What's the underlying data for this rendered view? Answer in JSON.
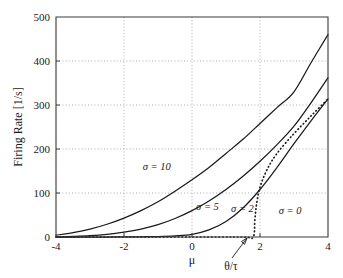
{
  "chart_data": {
    "type": "line",
    "title": "",
    "xlabel": "μ",
    "ylabel": "Firing Rate [1/s]",
    "xlim": [
      -4,
      4
    ],
    "ylim": [
      0,
      500
    ],
    "xticks": [
      -4,
      -2,
      0,
      2,
      4
    ],
    "xticklabels": [
      "-4",
      "-2",
      "0",
      "2",
      "4"
    ],
    "yticks": [
      0,
      100,
      200,
      300,
      400,
      500
    ],
    "yticklabels": [
      "0",
      "100",
      "200",
      "300",
      "400",
      "500"
    ],
    "grid": true,
    "grid_style": "dotted",
    "legend_position": "inline-annotations",
    "annotations": [
      {
        "text": "θ/τ",
        "x": 1.8,
        "y": 0,
        "note": "arrow pointing to threshold onset of the sigma = 0 curve"
      }
    ],
    "series": [
      {
        "name": "σ = 10",
        "label": "σ = 10",
        "style": "solid",
        "x": [
          -4,
          -3.5,
          -3,
          -2.5,
          -2,
          -1.5,
          -1,
          -0.5,
          0,
          0.5,
          1,
          1.5,
          2,
          2.5,
          3,
          3.5,
          4
        ],
        "values": [
          4,
          10,
          18,
          29,
          43,
          60,
          80,
          104,
          130,
          158,
          190,
          222,
          258,
          294,
          330,
          396,
          460
        ]
      },
      {
        "name": "σ = 5",
        "label": "σ = 5",
        "style": "solid",
        "x": [
          -4,
          -3.5,
          -3,
          -2.5,
          -2,
          -1.5,
          -1,
          -0.5,
          0,
          0.5,
          1,
          1.5,
          2,
          2.5,
          3,
          3.5,
          4
        ],
        "values": [
          0.5,
          1.5,
          3,
          6,
          11,
          18,
          28,
          42,
          60,
          82,
          108,
          138,
          172,
          210,
          252,
          305,
          362
        ]
      },
      {
        "name": "σ = 2",
        "label": "σ = 2",
        "style": "solid",
        "x": [
          -4,
          -3.5,
          -3,
          -2.5,
          -2,
          -1.5,
          -1,
          -0.5,
          0,
          0.5,
          1,
          1.5,
          2,
          2.5,
          3,
          3.5,
          4
        ],
        "values": [
          0,
          0,
          0,
          0,
          0.2,
          0.5,
          1,
          2.5,
          6,
          16,
          35,
          66,
          108,
          158,
          212,
          264,
          314
        ]
      },
      {
        "name": "σ = 0",
        "label": "σ = 0",
        "style": "dotted",
        "x": [
          -4,
          -2,
          0,
          1.5,
          1.8,
          1.85,
          1.9,
          2,
          2.2,
          2.5,
          3,
          3.5,
          4
        ],
        "values": [
          0,
          0,
          0,
          0,
          0,
          40,
          75,
          113,
          152,
          190,
          235,
          275,
          314
        ]
      }
    ],
    "curve_labels": [
      {
        "text": "σ = 10",
        "x": -1.45,
        "y": 152
      },
      {
        "text": "σ = 5",
        "x": 0.12,
        "y": 62
      },
      {
        "text": "σ = 2",
        "x": 1.15,
        "y": 57
      },
      {
        "text": "σ = 0",
        "x": 2.55,
        "y": 52
      }
    ]
  }
}
